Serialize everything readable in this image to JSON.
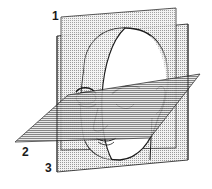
{
  "figure": {
    "planes": [
      {
        "number": "1",
        "orientation": "sagittal"
      },
      {
        "number": "2",
        "orientation": "horizontal"
      },
      {
        "number": "3",
        "orientation": "frontal"
      }
    ]
  },
  "labels": {
    "plane1": "1",
    "plane2": "2",
    "plane3": "3"
  },
  "colors": {
    "ink": "#1a1a1a",
    "dot_fill": "#d8d8d8",
    "dark_fill": "#9a9a9a",
    "background": "#ffffff"
  }
}
